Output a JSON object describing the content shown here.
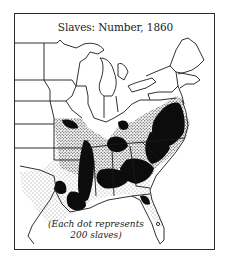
{
  "map": {
    "title": "Slaves: Number, 1860",
    "legend_line1": "(Each dot represents",
    "legend_line2": "200 slaves)",
    "dot_value": 200,
    "year": 1860,
    "subject": "Slaves: Number",
    "colors": {
      "dots": "#111111",
      "outline": "#1a1a1a",
      "background": "#ffffff"
    }
  }
}
